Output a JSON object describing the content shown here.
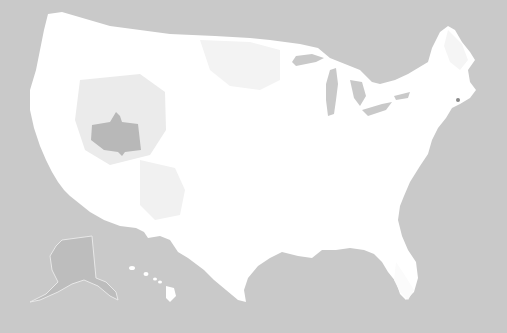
{
  "map": {
    "type": "choropleth",
    "region": "United States (contiguous, with Alaska and Hawaii insets)",
    "level": "county",
    "palette": {
      "background": "#c9c9c9",
      "land_base": "#ffffff",
      "tier_light": "#f2f2f2",
      "tier_mid": "#e6e6e6",
      "tier_dark": "#b5b5b5",
      "great_lakes": "#c9c9c9",
      "alaska_fill": "#bdbdbd"
    },
    "highlighted_regions": [
      {
        "name": "central-nevada-utah-block",
        "shade": "tier_dark"
      },
      {
        "name": "great-basin-surround",
        "shade": "tier_mid"
      },
      {
        "name": "northern-plains",
        "shade": "tier_light"
      },
      {
        "name": "southwest-arizona-new-mexico",
        "shade": "tier_light"
      },
      {
        "name": "alaska-inset",
        "shade": "alaska_fill"
      }
    ],
    "insets": [
      "Alaska",
      "Hawaii"
    ]
  }
}
